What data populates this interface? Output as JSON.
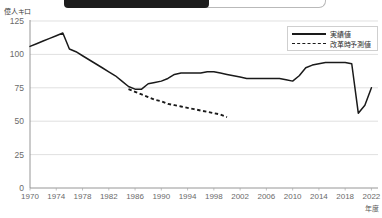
{
  "banner": {
    "present": true,
    "description": "cropped-dark-title-bar"
  },
  "chart_data": {
    "type": "line",
    "title": "",
    "ylabel": "億人キロ",
    "xlabel": "年度",
    "ylim": [
      0,
      125
    ],
    "yticks": [
      0,
      25,
      50,
      75,
      100,
      125
    ],
    "ytick_labels": [
      "0",
      "25",
      "50",
      "75",
      "100",
      "125"
    ],
    "xlim": [
      1970,
      2023
    ],
    "xticks": [
      1970,
      1974,
      1978,
      1982,
      1986,
      1990,
      1994,
      1998,
      2002,
      2006,
      2010,
      2014,
      2018,
      2022
    ],
    "xtick_labels": [
      "1970",
      "1974",
      "1978",
      "1982",
      "1986",
      "1990",
      "1994",
      "1998",
      "2002",
      "2006",
      "2010",
      "2014",
      "2018",
      "2022"
    ],
    "grid": true,
    "grid_axis": "y",
    "legend_position": "top-right",
    "series": [
      {
        "name": "実績値",
        "style": "solid",
        "color": "#1a1a1a",
        "x": [
          1970,
          1971,
          1972,
          1973,
          1974,
          1975,
          1976,
          1977,
          1978,
          1979,
          1980,
          1981,
          1982,
          1983,
          1984,
          1985,
          1986,
          1987,
          1988,
          1989,
          1990,
          1991,
          1992,
          1993,
          1994,
          1995,
          1996,
          1997,
          1998,
          1999,
          2000,
          2001,
          2002,
          2003,
          2004,
          2005,
          2006,
          2007,
          2008,
          2009,
          2010,
          2011,
          2012,
          2013,
          2014,
          2015,
          2016,
          2017,
          2018,
          2019,
          2020,
          2021,
          2022
        ],
        "values": [
          106,
          108,
          110,
          112,
          114,
          116,
          104,
          102,
          99,
          96,
          93,
          90,
          87,
          84,
          80,
          76,
          74,
          74,
          78,
          79,
          80,
          82,
          85,
          86,
          86,
          86,
          86,
          87,
          87,
          86,
          85,
          84,
          83,
          82,
          82,
          82,
          82,
          82,
          82,
          81,
          80,
          84,
          90,
          92,
          93,
          94,
          94,
          94,
          94,
          93,
          56,
          62,
          75
        ]
      },
      {
        "name": "改革時予測値",
        "style": "dashed",
        "color": "#1a1a1a",
        "x": [
          1985,
          1986,
          1987,
          1988,
          1989,
          1990,
          1991,
          1992,
          1993,
          1994,
          1995,
          1996,
          1997,
          1998,
          1999,
          2000
        ],
        "values": [
          74,
          72,
          70,
          68,
          66,
          65,
          63,
          62,
          61,
          60,
          59,
          58,
          57,
          56,
          55,
          53
        ]
      }
    ]
  }
}
